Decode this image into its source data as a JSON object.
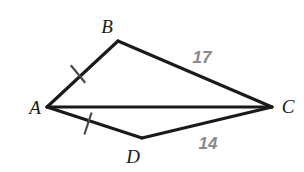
{
  "diagram": {
    "background_color": "#ffffff",
    "stroke_color": "#1a1a1a",
    "measure_color": "#8a8a8a",
    "vertices": [
      {
        "name": "A",
        "label": "A",
        "x": 47,
        "y": 107,
        "label_x": 35,
        "label_y": 107
      },
      {
        "name": "B",
        "label": "B",
        "x": 118,
        "y": 41,
        "label_x": 107,
        "label_y": 26
      },
      {
        "name": "C",
        "label": "C",
        "x": 272,
        "y": 107,
        "label_x": 288,
        "label_y": 106
      },
      {
        "name": "D",
        "label": "D",
        "x": 142,
        "y": 138,
        "label_x": 133,
        "label_y": 156
      }
    ],
    "segments": [
      {
        "name": "AB",
        "from": "A",
        "to": "B",
        "tick_marks": 1
      },
      {
        "name": "BC",
        "from": "B",
        "to": "C",
        "tick_marks": 0,
        "measure": "17"
      },
      {
        "name": "AC",
        "from": "A",
        "to": "C",
        "tick_marks": 0
      },
      {
        "name": "AD",
        "from": "A",
        "to": "D",
        "tick_marks": 1
      },
      {
        "name": "DC",
        "from": "D",
        "to": "C",
        "tick_marks": 0,
        "measure": "14"
      }
    ],
    "measure_labels": [
      {
        "name": "bc-length",
        "text": "17",
        "x": 202,
        "y": 57
      },
      {
        "name": "dc-length",
        "text": "14",
        "x": 208,
        "y": 143
      }
    ],
    "tick_marks": [
      {
        "name": "ab-tick",
        "segment": "AB",
        "x": 78,
        "y": 74
      },
      {
        "name": "ad-tick",
        "segment": "AD",
        "x": 88,
        "y": 123
      }
    ]
  }
}
